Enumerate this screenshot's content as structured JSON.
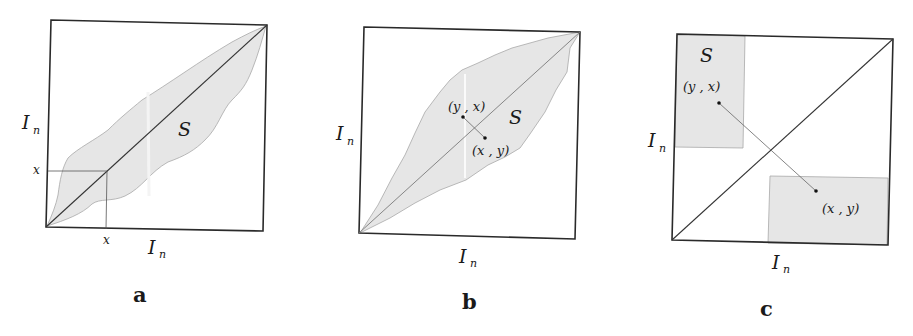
{
  "figure": {
    "panels": [
      {
        "id": "a",
        "letter": "a",
        "axis_x_label": "I",
        "axis_x_sub": "n",
        "axis_y_label": "I",
        "axis_y_sub": "n",
        "region_label": "S",
        "tick_x_label": "x",
        "tick_y_label": "x"
      },
      {
        "id": "b",
        "letter": "b",
        "axis_x_label": "I",
        "axis_x_sub": "n",
        "axis_y_label": "I",
        "axis_y_sub": "n",
        "region_label": "S",
        "point_upper_label": "(y , x)",
        "point_lower_label": "(x , y)"
      },
      {
        "id": "c",
        "letter": "c",
        "axis_x_label": "I",
        "axis_x_sub": "n",
        "axis_y_label": "I",
        "axis_y_sub": "n",
        "region_label": "S",
        "point_upper_label": "(y , x)",
        "point_lower_label": "(x , y)"
      }
    ],
    "colors": {
      "frame": "#2a2a2a",
      "region_fill": "#e6e6e6",
      "background": "#ffffff"
    }
  }
}
